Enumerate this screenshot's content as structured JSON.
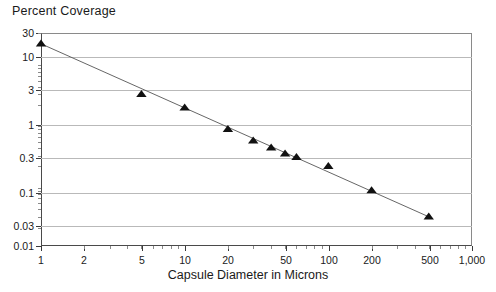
{
  "chart": {
    "title": "Percent Coverage",
    "xlabel": "Capsule Diameter in Microns"
  },
  "chart_data": {
    "type": "scatter",
    "title": "Percent Coverage",
    "subtitle": "",
    "xlabel": "Capsule Diameter in Microns",
    "ylabel": "Percent Coverage",
    "xscale": "log",
    "yscale": "log",
    "xlim": [
      1,
      1000
    ],
    "ylim": [
      0.01,
      30
    ],
    "grid": true,
    "legend": false,
    "xticks": [
      1,
      2,
      5,
      10,
      20,
      50,
      100,
      200,
      500,
      1000
    ],
    "xticklabels": [
      "1",
      "2",
      "5",
      "10",
      "20",
      "50",
      "100",
      "200",
      "500",
      "1,000"
    ],
    "yticks": [
      30,
      10,
      3,
      1,
      0.3,
      0.1,
      0.03,
      0.01
    ],
    "yticklabels": [
      "30",
      "10",
      "3",
      "1",
      "0.3",
      "0.1",
      "0.03",
      "0.01"
    ],
    "marker": "triangle",
    "marker_color": "#111111",
    "line_color": "#555555",
    "series": [
      {
        "name": "Coverage vs Capsule Diameter",
        "x": [
          1,
          5,
          10,
          20,
          30,
          40,
          50,
          60,
          100,
          200,
          500
        ],
        "y": [
          20,
          3,
          1.8,
          0.8,
          0.52,
          0.4,
          0.32,
          0.28,
          0.2,
          0.08,
          0.03
        ]
      }
    ],
    "fit_line": {
      "x": [
        1,
        500
      ],
      "y": [
        20,
        0.03
      ]
    }
  },
  "ytick_positions": [
    {
      "label": "30",
      "y": 0
    },
    {
      "label": "10",
      "y": 24
    },
    {
      "label": "3",
      "y": 57
    },
    {
      "label": "1",
      "y": 92
    },
    {
      "label": "0.3",
      "y": 125
    },
    {
      "label": "0.1",
      "y": 160
    },
    {
      "label": "0.03",
      "y": 193
    },
    {
      "label": "0.01",
      "y": 213
    }
  ],
  "xtick_positions": [
    {
      "label": "1",
      "x": 0
    },
    {
      "label": "2",
      "x": 43
    },
    {
      "label": "5",
      "x": 101
    },
    {
      "label": "10",
      "x": 144
    },
    {
      "label": "20",
      "x": 187
    },
    {
      "label": "50",
      "x": 245
    },
    {
      "label": "100",
      "x": 288
    },
    {
      "label": "200",
      "x": 331
    },
    {
      "label": "500",
      "x": 389
    },
    {
      "label": "1,000",
      "x": 431
    }
  ]
}
